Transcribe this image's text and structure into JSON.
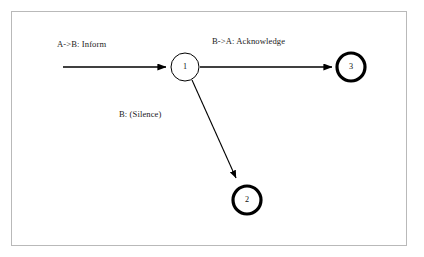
{
  "diagram": {
    "background_color": "#ffffff",
    "frame_color": "#b9b9b9",
    "stroke_color": "#000000",
    "text_color": "#1b1b1b",
    "nodes": [
      {
        "id": "1",
        "label": "1",
        "cx": 185,
        "cy": 67,
        "r": 14,
        "stroke_width": 1,
        "type": "state",
        "accepting": false
      },
      {
        "id": "2",
        "label": "2",
        "cx": 247,
        "cy": 200,
        "r": 14,
        "stroke_width": 3.2,
        "type": "state",
        "accepting": true
      },
      {
        "id": "3",
        "label": "3",
        "cx": 351,
        "cy": 67,
        "r": 14,
        "stroke_width": 3.2,
        "type": "state",
        "accepting": true
      }
    ],
    "edges": [
      {
        "id": "start-to-1",
        "from": "start",
        "to": "1",
        "label": "A->B: Inform",
        "label_x": 57,
        "label_y": 40,
        "x1": 63,
        "y1": 67,
        "x2": 170,
        "y2": 67
      },
      {
        "id": "1-to-3",
        "from": "1",
        "to": "3",
        "label": "B->A: Acknowledge",
        "label_x": 212,
        "label_y": 37,
        "x1": 200,
        "y1": 67,
        "x2": 336,
        "y2": 67
      },
      {
        "id": "1-to-2",
        "from": "1",
        "to": "2",
        "label": "B: (Silence)",
        "label_x": 119,
        "label_y": 110,
        "x1": 192,
        "y1": 80,
        "x2": 239,
        "y2": 184
      }
    ]
  }
}
